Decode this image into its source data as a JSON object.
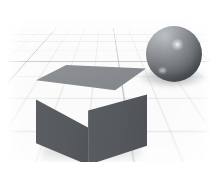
{
  "figure": {
    "kind": "3d-rendered-scene",
    "background_color": "#ffffff",
    "caption": ""
  },
  "scene": {
    "name": "cube-and-sphere-on-grid",
    "floor": {
      "name": "perspective-grid-floor",
      "base_color": "#fbfbfb",
      "major_line_color": "#969ca2",
      "minor_line_color": "#b9bec3"
    },
    "objects": [
      {
        "id": "cube",
        "label": "cube",
        "material": "matte-gray",
        "top_face_color": "#8a8e93",
        "left_face_color": "#56595e",
        "right_face_color": "#55595e",
        "shadow_color": "#6e7277"
      },
      {
        "id": "sphere",
        "label": "sphere",
        "material": "glossy-metallic-gray",
        "body_color": "#70747a",
        "highlight_color": "#ffffff",
        "shadow_color": "#5f6469"
      }
    ]
  }
}
